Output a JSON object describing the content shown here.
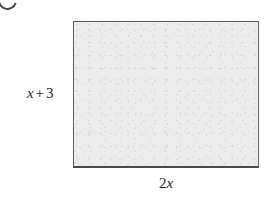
{
  "figure": {
    "type": "rectangle",
    "fill_color": "#ececec",
    "border_color": "#5a5a5a",
    "background_color": "#ffffff",
    "labels": {
      "height": {
        "full_text": "x + 3",
        "variable": "x",
        "operator": "+",
        "constant": "3",
        "position": "left"
      },
      "width": {
        "full_text": "2x",
        "coefficient": "2",
        "variable": "x",
        "position": "bottom"
      }
    }
  }
}
